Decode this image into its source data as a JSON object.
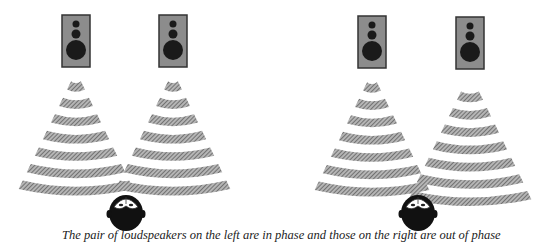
{
  "figure": {
    "caption": "The pair of loudspeakers on the left are in phase and those on the right are out of phase",
    "panels": [
      {
        "name": "in-phase",
        "speakers": 2,
        "phase": "in phase",
        "listener": "head"
      },
      {
        "name": "out-of-phase",
        "speakers": 2,
        "phase": "out of phase",
        "listener": "head"
      }
    ],
    "colors": {
      "wave": "#8a8a8a",
      "speaker_body": "#8c8c8c",
      "speaker_border": "#333333",
      "driver": "#1a1a1a",
      "head": "#111111"
    }
  }
}
